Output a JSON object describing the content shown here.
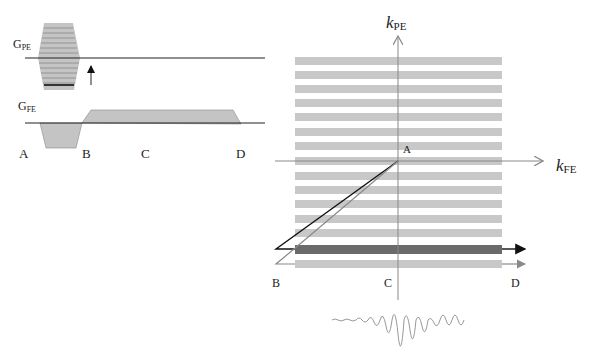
{
  "figure": {
    "type": "MRI gradient-echo pulse sequence and k-space trajectory diagram",
    "left_panel": {
      "gpe_label": {
        "main": "G",
        "sub": "PE"
      },
      "gfe_label": {
        "main": "G",
        "sub": "FE"
      },
      "time_points": [
        "A",
        "B",
        "C",
        "D"
      ]
    },
    "right_panel": {
      "kpe_label": {
        "main": "k",
        "sub": "PE"
      },
      "kfe_label": {
        "main": "k",
        "sub": "FE"
      },
      "origin_label": "A",
      "bottom_labels": [
        "B",
        "C",
        "D"
      ],
      "stripe_count_upper": 7,
      "stripe_count_lower": 9,
      "highlighted_line": "current phase-encode line (dark)",
      "echo_signal": "decaying oscillation centered at C"
    },
    "colors": {
      "stripe": "#c8c8c8",
      "highlight": "#6a6a6a",
      "axis": "#888888",
      "trajectory_black": "#111111",
      "trajectory_gray": "#8a8a8a",
      "gradient_fill": "#c4c4c4"
    }
  }
}
